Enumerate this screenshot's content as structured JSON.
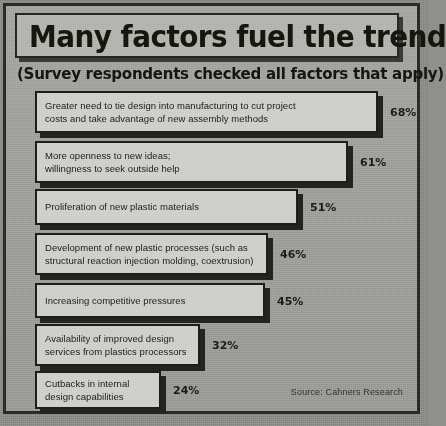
{
  "chart_data": {
    "type": "bar",
    "orientation": "horizontal",
    "title": "Many factors fuel the trend",
    "subtitle": "(Survey respondents checked all factors that apply)",
    "source": "Source: Cahners Research",
    "xlabel": "",
    "ylabel": "",
    "xlim": [
      0,
      68
    ],
    "grid": false,
    "legend": false,
    "value_suffix": "%",
    "categories": [
      "Greater need to tie design into manufacturing to cut project costs and take advantage of new assembly methods",
      "More openness to new ideas; willingness to seek outside help",
      "Proliferation of new plastic materials",
      "Development of new plastic processes (such as structural reaction injection molding, coextrusion)",
      "Increasing competitive pressures",
      "Availability of improved design services from plastics processors",
      "Cutbacks in internal design capabilities"
    ],
    "values": [
      68,
      61,
      51,
      46,
      45,
      32,
      24
    ],
    "value_labels": [
      "68%",
      "61%",
      "51%",
      "46%",
      "45%",
      "32%",
      "24%"
    ]
  },
  "bars": [
    {
      "label": "Greater need to tie design into manufacturing to cut project\ncosts and take advantage of new assembly methods",
      "value": 68,
      "value_label": "68%",
      "top": 88,
      "left": 29,
      "width": 343,
      "height": 42
    },
    {
      "label": "More openness to new ideas;\nwillingness to seek outside help",
      "value": 61,
      "value_label": "61%",
      "top": 138,
      "left": 29,
      "width": 313,
      "height": 42
    },
    {
      "label": "Proliferation of new plastic materials",
      "value": 51,
      "value_label": "51%",
      "top": 186,
      "left": 29,
      "width": 263,
      "height": 36
    },
    {
      "label": "Development of new plastic processes (such as\nstructural reaction injection molding, coextrusion)",
      "value": 46,
      "value_label": "46%",
      "top": 230,
      "left": 29,
      "width": 233,
      "height": 42
    },
    {
      "label": "Increasing competitive pressures",
      "value": 45,
      "value_label": "45%",
      "top": 280,
      "left": 29,
      "width": 230,
      "height": 35
    },
    {
      "label": "Availability of improved design\nservices from plastics processors",
      "value": 32,
      "value_label": "32%",
      "top": 321,
      "left": 29,
      "width": 165,
      "height": 42
    },
    {
      "label": "Cutbacks in internal\ndesign capabilities",
      "value": 24,
      "value_label": "24%",
      "top": 368,
      "left": 29,
      "width": 126,
      "height": 38
    }
  ],
  "colors": {
    "page_background": "#8c8c89",
    "panel_background": "#a3a3a0",
    "border": "#2a2a28",
    "bar_fill": "#cfcfcc",
    "bar_border": "#1d1d1b",
    "shadow": "#232321",
    "text": "#1b1b19"
  }
}
